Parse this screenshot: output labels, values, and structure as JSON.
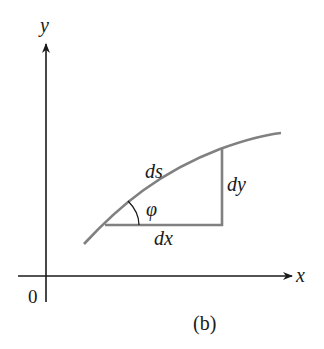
{
  "figure": {
    "caption": "(b)",
    "origin_label": "0",
    "x_axis_label": "x",
    "y_axis_label": "y",
    "arc_length_label": "ds",
    "angle_label": "φ",
    "dx_label": "dx",
    "dy_label": "dy"
  },
  "colors": {
    "axis": "#1a1a1a",
    "curve": "#808080",
    "triangle": "#808080",
    "text": "#1a1a1a"
  }
}
